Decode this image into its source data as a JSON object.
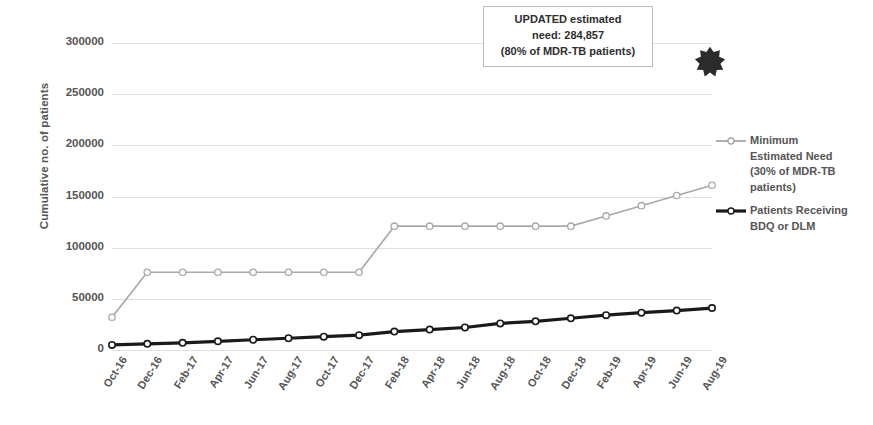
{
  "chart_data": {
    "type": "line",
    "title": "",
    "xlabel": "",
    "ylabel": "Cumulative no. of patients",
    "ylim": [
      0,
      300000
    ],
    "ytick_values": [
      0,
      50000,
      100000,
      150000,
      200000,
      250000,
      300000
    ],
    "ytick_labels": [
      "0",
      "50000",
      "100000",
      "150000",
      "200000",
      "250000",
      "300000"
    ],
    "grid": true,
    "legend_position": "right",
    "categories": [
      "Oct-16",
      "Dec-16",
      "Feb-17",
      "Apr-17",
      "Jun-17",
      "Aug-17",
      "Oct-17",
      "Dec-17",
      "Feb-18",
      "Apr-18",
      "Jun-18",
      "Aug-18",
      "Oct-18",
      "Dec-18",
      "Feb-19",
      "Apr-19",
      "Jun-19",
      "Aug-19"
    ],
    "series": [
      {
        "name": "Minimum Estimated Need (30% of MDR-TB patients)",
        "color": "#a9a9a9",
        "marker": "circle-open",
        "values": [
          32000,
          76000,
          76000,
          76000,
          76000,
          76000,
          76000,
          76000,
          121000,
          121000,
          121000,
          121000,
          121000,
          121000,
          131000,
          141000,
          151000,
          161000
        ]
      },
      {
        "name": "Patients Receiving BDQ or DLM",
        "color": "#1a1a1a",
        "marker": "circle-open",
        "values": [
          5000,
          6000,
          7000,
          8500,
          10000,
          11500,
          13000,
          14500,
          18000,
          20000,
          22000,
          26000,
          28000,
          31000,
          34000,
          36500,
          38500,
          41000
        ]
      }
    ],
    "annotations": [
      {
        "name": "updated-estimated-need-callout",
        "lines": [
          "UPDATED estimated",
          "need: 284,857",
          "(80% of MDR-TB patients)"
        ]
      }
    ],
    "markers": [
      {
        "name": "burst-marker",
        "shape": "star-burst",
        "color": "#2b2b2b"
      }
    ]
  },
  "legend": {
    "items": [
      {
        "lines": [
          "Minimum",
          "Estimated Need",
          "(30% of MDR-TB",
          "patients)"
        ],
        "color": "#a9a9a9"
      },
      {
        "lines": [
          "Patients Receiving",
          "BDQ or DLM"
        ],
        "color": "#1a1a1a"
      }
    ]
  }
}
